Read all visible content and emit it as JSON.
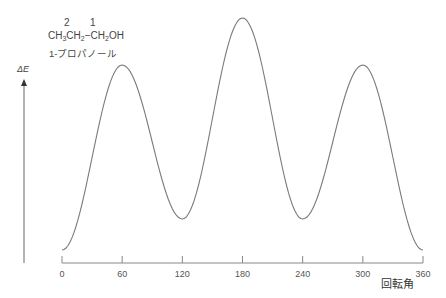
{
  "molecule": {
    "carbon_numbers": [
      "2",
      "1"
    ],
    "formula_parts": [
      "CH",
      "3",
      "CH",
      "2",
      "−CH",
      "2",
      "OH"
    ],
    "name": "1-プロパノール"
  },
  "chart_data": {
    "type": "line",
    "title": "",
    "xlabel": "回転角",
    "ylabel": "ΔE",
    "x_ticks": [
      0,
      60,
      120,
      180,
      240,
      300,
      360
    ],
    "xlim": [
      0,
      360
    ],
    "y_axis": "arrow only, no ticks (relative energy, arbitrary units)",
    "grid": false,
    "legend": null,
    "series": [
      {
        "name": "ΔE (relative)",
        "x": [
          0,
          60,
          120,
          180,
          240,
          300,
          360
        ],
        "y": [
          0,
          185,
          31,
          232,
          31,
          185,
          0
        ]
      }
    ],
    "annotations": [
      "CH3CH2−CH2OH",
      "1-プロパノール",
      "2",
      "1"
    ]
  },
  "colors": {
    "curve": "#7a7a7a",
    "axis": "#888888",
    "text": "#444444"
  }
}
